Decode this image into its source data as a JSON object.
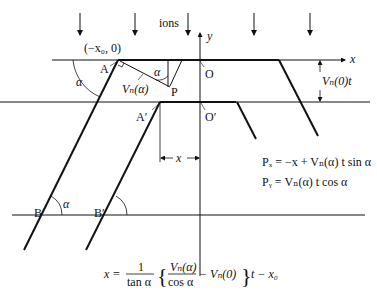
{
  "diagram": {
    "title_label": "ions",
    "axes": {
      "x_label": "x",
      "y_label": "y"
    },
    "points": {
      "origin_start": "(−x₀, 0)",
      "A": "A",
      "A_prime": "A′",
      "P": "P",
      "O": "O",
      "O_prime": "O′",
      "B": "B",
      "B_prime": "B′"
    },
    "angle_label": "α",
    "vn_alpha_label": "Vₙ(α)",
    "vn0_t_label": "Vₙ(0)t",
    "x_dimension_label": "x",
    "equations": {
      "px": "Pₓ = −x + Vₙ(α) t sin α",
      "py": "Pᵧ = Vₙ(α) t cos α",
      "main_lhs": "x =",
      "main_frac_num": "1",
      "main_frac_den": "tan α",
      "main_inner_num": "Vₙ(α)",
      "main_inner_den": "cos α",
      "main_inner_minus": "− Vₙ(0)",
      "main_tail": "t − x₀"
    },
    "ion_arrow_count": 6
  }
}
